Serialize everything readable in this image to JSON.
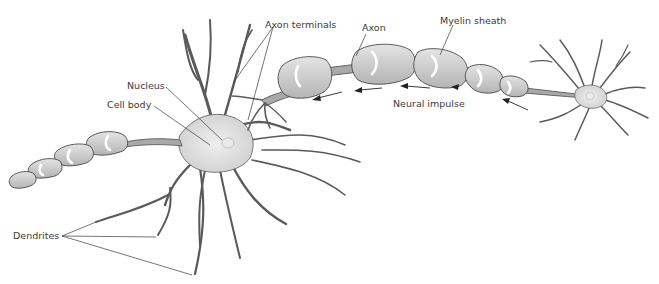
{
  "diagram": {
    "labels": {
      "axon_terminals": "Axon terminals",
      "axon": "Axon",
      "myelin_sheath": "Myelin sheath",
      "nucleus": "Nucleus",
      "cell_body": "Cell body",
      "neural_impulse": "Neural impulse",
      "dendrites": "Dendrites"
    },
    "colors": {
      "cell_fill": "#d9d9d9",
      "myelin_fill": "#cfcfcf",
      "outline": "#4a4a4a",
      "text": "#3a3a3a",
      "background": "#ffffff"
    }
  }
}
